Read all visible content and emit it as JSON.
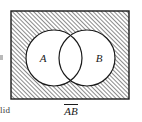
{
  "figure": {
    "type": "venn-diagram",
    "universe_label": "",
    "caption": {
      "formula_parts": [
        "A",
        "B"
      ],
      "formula_plain": "A̅B̅",
      "meaning": "complement of A union B"
    },
    "sets": [
      {
        "id": "A",
        "label": "A",
        "center_x": 54,
        "center_y": 58,
        "radius": 28
      },
      {
        "id": "B",
        "label": "B",
        "center_x": 87,
        "center_y": 58,
        "radius": 28
      }
    ],
    "universe_rect": {
      "x": 11,
      "y": 11,
      "width": 118,
      "height": 88
    },
    "shaded_region": "outside-both-circles",
    "shading": {
      "style": "diagonal-hatch",
      "direction": "forward-slash",
      "spacing_px": 3,
      "line_color": "#2b2b2b",
      "background_color": "#ffffff"
    },
    "colors": {
      "outline": "#1a1a1a",
      "circle_fill": "#ffffff",
      "hatch": "#2b2b2b",
      "text": "#1a1a1a",
      "fragment_text": "#3a3a3a"
    }
  },
  "page_fragments": {
    "bottom_left_text": "lid"
  }
}
